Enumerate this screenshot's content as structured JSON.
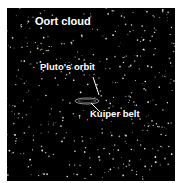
{
  "diagram": {
    "background_color": "#000000",
    "star_color": "#ffffff",
    "labels": {
      "oort_cloud": "Oort cloud",
      "plutos_orbit": "Pluto's orbit",
      "kuiper_belt": "Kuiper belt"
    },
    "star_count": 420,
    "star_seed": 7
  }
}
